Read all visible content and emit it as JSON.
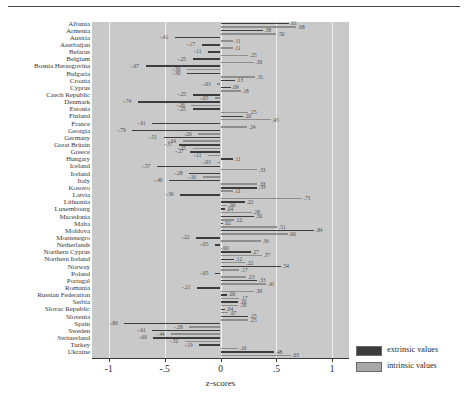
{
  "figure": {
    "xlabel": "z-scores",
    "tick_labels": [
      "-1",
      "-.5",
      "0",
      ".5",
      "1"
    ],
    "tick_values": [
      -1,
      -0.5,
      0,
      0.5,
      1
    ]
  },
  "legend": {
    "items": [
      {
        "key": "extrinsic",
        "label": "extrinsic values",
        "color": "#3c3c3c"
      },
      {
        "key": "intrinsic",
        "label": "intrinsic values",
        "color": "#a8a8a8"
      }
    ]
  },
  "chart_data": {
    "type": "bar",
    "title": "",
    "subtitle": "",
    "xlabel": "z-scores",
    "ylabel": "",
    "xlim": [
      -1.15,
      1.15
    ],
    "grid": true,
    "legend_position": "right-bottom",
    "orientation": "horizontal",
    "categories": [
      "Albania",
      "Armenia",
      "Austria",
      "Azerbaijan",
      "Belarus",
      "Belgium",
      "Bosnia Herzegovina",
      "Bulgaria",
      "Croatia",
      "Cyprus",
      "Czech Republic",
      "Denmark",
      "Estonia",
      "Finland",
      "France",
      "Georgia",
      "Germany",
      "Great Britain",
      "Greece",
      "Hungary",
      "Iceland",
      "Ireland",
      "Italy",
      "Kosovo",
      "Latvia",
      "Lithuania",
      "Luxembourg",
      "Macedonia",
      "Malta",
      "Moldova",
      "Montenegro",
      "Netherlands",
      "Northern Cyprus",
      "Northern Ireland",
      "Norway",
      "Poland",
      "Portugal",
      "Romania",
      "Russian Federation",
      "Serbia",
      "Slovac Republic",
      "Slovenia",
      "Spain",
      "Sweden",
      "Switzerland",
      "Turkey",
      "Ukraine"
    ],
    "series": [
      {
        "name": "extrinsic values",
        "color": "#3c3c3c",
        "values": [
          0.61,
          0.38,
          -0.41,
          -0.17,
          -0.11,
          -0.25,
          -0.67,
          -0.3,
          0.13,
          0.09,
          -0.25,
          -0.74,
          -0.25,
          0.2,
          -0.61,
          -0.79,
          -0.51,
          -0.37,
          -0.27,
          0.11,
          -0.57,
          -0.28,
          -0.46,
          0.33,
          -0.36,
          0.22,
          0.04,
          0.3,
          0.02,
          0.84,
          -0.22,
          -0.05,
          0.27,
          0.12,
          0.54,
          -0.05,
          0.33,
          -0.21,
          0.06,
          0.16,
          0.04,
          0.25,
          -0.86,
          -0.61,
          -0.6,
          -0.19,
          0.48
        ]
      },
      {
        "name": "intrinsic values",
        "color": "#8e8e8e",
        "values": [
          0.68,
          0.5,
          0.11,
          0.11,
          0.25,
          0.3,
          -0.3,
          0.31,
          -0.03,
          0.18,
          -0.05,
          -0.26,
          0.25,
          0.45,
          0.24,
          -0.2,
          -0.34,
          -0.25,
          -0.11,
          -0.03,
          0.33,
          -0.16,
          0.33,
          0.11,
          0.73,
          0.06,
          0.28,
          0.12,
          0.51,
          0.6,
          0.36,
          0.0,
          0.37,
          0.22,
          0.17,
          0.23,
          0.41,
          0.3,
          0.17,
          0.16,
          0.07,
          0.25,
          -0.28,
          -0.44,
          -0.32,
          0.16,
          0.63
        ]
      }
    ]
  }
}
